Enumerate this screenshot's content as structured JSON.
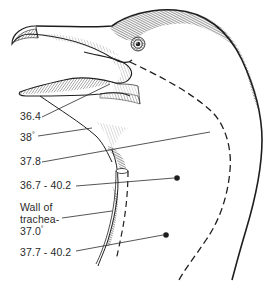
{
  "figure": {
    "colors": {
      "ink": "#1e1e1e",
      "text": "#2a2a2a",
      "background": "#ffffff"
    },
    "labels": [
      {
        "id": "mouth",
        "text": "36.4",
        "x": 20,
        "y": 110
      },
      {
        "id": "throat-skin",
        "text": "38",
        "unit": "°",
        "x": 20,
        "y": 132
      },
      {
        "id": "neck-surface",
        "text": "37.8",
        "x": 20,
        "y": 155
      },
      {
        "id": "deep-neck-upper",
        "text": "36.7 - 40.2",
        "x": 20,
        "y": 178
      },
      {
        "id": "trachea-line1",
        "text": "Wall of",
        "x": 20,
        "y": 200
      },
      {
        "id": "trachea-line2",
        "text": "trachea-",
        "x": 20,
        "y": 212
      },
      {
        "id": "trachea-line3",
        "text": "37.0",
        "unit": "°",
        "x": 20,
        "y": 224
      },
      {
        "id": "deep-neck-lower",
        "text": "37.7 - 40.2",
        "x": 20,
        "y": 246
      }
    ],
    "markers": [
      {
        "id": "dot-upper",
        "x": 177,
        "y": 178
      },
      {
        "id": "dot-lower",
        "x": 166,
        "y": 235
      }
    ]
  }
}
